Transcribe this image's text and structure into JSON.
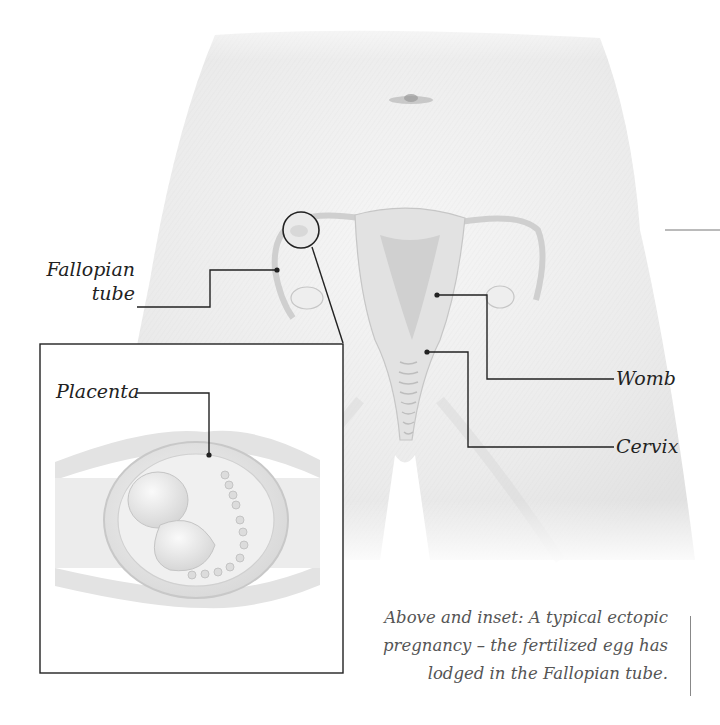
{
  "figure": {
    "type": "anatomical-illustration",
    "subject": "ectopic pregnancy",
    "colors": {
      "background": "#ffffff",
      "skin": "#ececec",
      "organ": "#dcdcdc",
      "leader_line": "#222222",
      "label_text": "#222222",
      "caption_text": "#555555"
    }
  },
  "labels": {
    "fallopian_line1": "Fallopian",
    "fallopian_line2": "tube",
    "placenta": "Placenta",
    "womb": "Womb",
    "cervix": "Cervix"
  },
  "caption": {
    "line1": "Above and inset: A typical ectopic",
    "line2": "pregnancy – the fertilized egg has",
    "line3": "lodged in the Fallopian tube."
  }
}
